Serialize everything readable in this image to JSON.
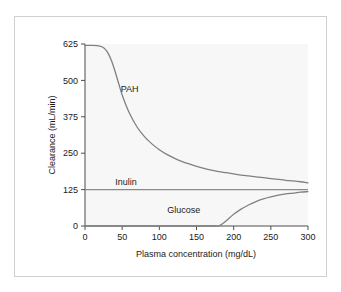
{
  "chart_data": {
    "type": "line",
    "title": "",
    "xlabel": "Plasma concentration (mg/dL)",
    "ylabel": "Clearance (mL/min)",
    "xlim": [
      0,
      300
    ],
    "ylim": [
      0,
      625
    ],
    "xticks": [
      0,
      50,
      100,
      150,
      200,
      250,
      300
    ],
    "yticks": [
      0,
      125,
      250,
      375,
      500,
      625
    ],
    "xtick_labels": [
      "0",
      "50",
      "100",
      "150",
      "200",
      "250",
      "300"
    ],
    "ytick_labels": [
      "0",
      "125",
      "250",
      "375",
      "500",
      "625"
    ],
    "grid": false,
    "legend": "inline-labels",
    "plot_background": "#f7f7f7",
    "line_color": "#808080",
    "series": [
      {
        "name": "PAH",
        "label": "PAH",
        "label_x": 60,
        "label_y": 470,
        "x": [
          0,
          10,
          20,
          25,
          30,
          35,
          40,
          45,
          50,
          60,
          70,
          80,
          90,
          100,
          110,
          120,
          130,
          140,
          150,
          160,
          170,
          180,
          190,
          200,
          210,
          220,
          230,
          240,
          250,
          260,
          270,
          280,
          290,
          300
        ],
        "values": [
          620,
          620,
          618,
          612,
          598,
          572,
          535,
          492,
          450,
          386,
          340,
          307,
          282,
          262,
          246,
          233,
          222,
          213,
          205,
          198,
          192,
          187,
          183,
          179,
          175,
          172,
          169,
          166,
          163,
          160,
          157,
          155,
          152,
          148
        ]
      },
      {
        "name": "Inulin",
        "label": "Inulin",
        "label_x": 55,
        "label_y": 152,
        "x": [
          0,
          300
        ],
        "values": [
          125,
          125
        ]
      },
      {
        "name": "Glucose",
        "label": "Glucose",
        "label_x": 133,
        "label_y": 55,
        "x": [
          0,
          20,
          40,
          60,
          80,
          100,
          120,
          140,
          160,
          175,
          180,
          185,
          190,
          200,
          210,
          220,
          230,
          240,
          250,
          260,
          270,
          280,
          290,
          300
        ],
        "values": [
          0,
          0,
          0,
          0,
          0,
          0,
          0,
          0,
          0,
          0,
          0,
          8,
          18,
          40,
          58,
          72,
          84,
          93,
          100,
          106,
          110,
          113,
          116,
          118
        ]
      }
    ]
  }
}
